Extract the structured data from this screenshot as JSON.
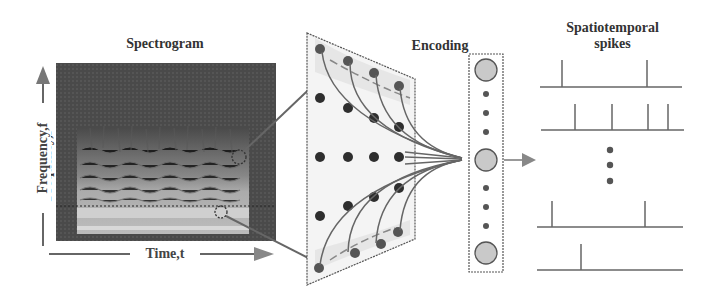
{
  "labels": {
    "spectrogram_title": "Spectrogram",
    "encoding_title": "Encoding",
    "spikes_title_line1": "Spatiotemporal",
    "spikes_title_line2": "spikes",
    "y_axis": "Frequency,f",
    "x_axis": "Time,t"
  },
  "colors": {
    "ink": "#555555",
    "spectro_bg": "#4a4a4a",
    "spectro_light": "#bdbdbd",
    "panel_fill": "#eeeeee",
    "neuron_dark": "#3a3a3a",
    "neuron_light": "#c8c8c8"
  },
  "spike_trains": [
    {
      "y": 87,
      "x0": 540,
      "x1": 682,
      "spikes": [
        562,
        647
      ]
    },
    {
      "y": 130,
      "x0": 541,
      "x1": 684,
      "spikes": [
        575,
        612,
        648,
        668
      ]
    },
    {
      "y": 227,
      "x0": 537,
      "x1": 683,
      "spikes": [
        552,
        645
      ]
    },
    {
      "y": 270,
      "x0": 537,
      "x1": 683,
      "spikes": [
        581
      ]
    }
  ],
  "encoding_column": {
    "large_neurons": 3,
    "small_neurons_per_gap": 3
  }
}
